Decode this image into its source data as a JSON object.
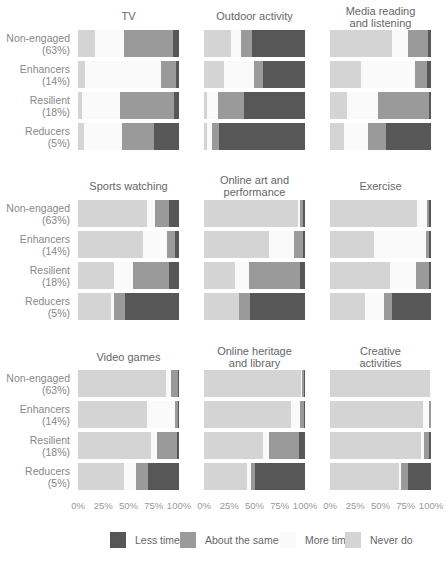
{
  "colors": {
    "less_time": "#575757",
    "about_same": "#9a9a9a",
    "more_time": "#fafafa",
    "never_do": "#d4d4d4"
  },
  "groups": [
    {
      "name": "Non-engaged",
      "share": "(63%)"
    },
    {
      "name": "Enhancers",
      "share": "(14%)"
    },
    {
      "name": "Resilient",
      "share": "(18%)"
    },
    {
      "name": "Reducers",
      "share": "(5%)"
    }
  ],
  "axis_ticks": [
    "0%",
    "25%",
    "50%",
    "75%",
    "100%"
  ],
  "legend": [
    {
      "label": "Less time",
      "key": "less_time"
    },
    {
      "label": "About the same",
      "key": "about_same"
    },
    {
      "label": "More time",
      "key": "more_time"
    },
    {
      "label": "Never do",
      "key": "never_do"
    }
  ],
  "chart_data": {
    "type": "bar",
    "orientation": "horizontal",
    "stacked": true,
    "normalized": true,
    "xlabel": "",
    "ylabel": "",
    "xlim": [
      0,
      100
    ],
    "grid": false,
    "legend_position": "bottom",
    "categories": [
      "Non-engaged (63%)",
      "Enhancers (14%)",
      "Resilient (18%)",
      "Reducers (5%)"
    ],
    "segment_order": [
      "Never do",
      "More time",
      "About the same",
      "Less time"
    ],
    "panels": [
      {
        "title": "TV",
        "series": [
          {
            "name": "Never do",
            "values": [
              17,
              7,
              4,
              6
            ]
          },
          {
            "name": "More time",
            "values": [
              29,
              75,
              38,
              38
            ]
          },
          {
            "name": "About the same",
            "values": [
              48,
              15,
              53,
              31
            ]
          },
          {
            "name": "Less time",
            "values": [
              6,
              3,
              5,
              25
            ]
          }
        ]
      },
      {
        "title": "Outdoor activity",
        "series": [
          {
            "name": "Never do",
            "values": [
              27,
              20,
              3,
              3
            ]
          },
          {
            "name": "More time",
            "values": [
              10,
              30,
              11,
              5
            ]
          },
          {
            "name": "About the same",
            "values": [
              11,
              8,
              26,
              7
            ]
          },
          {
            "name": "Less time",
            "values": [
              52,
              42,
              60,
              85
            ]
          }
        ]
      },
      {
        "title": "Media reading and listening",
        "series": [
          {
            "name": "Never do",
            "values": [
              61,
              31,
              17,
              14
            ]
          },
          {
            "name": "More time",
            "values": [
              16,
              53,
              31,
              24
            ]
          },
          {
            "name": "About the same",
            "values": [
              20,
              12,
              50,
              17
            ]
          },
          {
            "name": "Less time",
            "values": [
              3,
              4,
              2,
              45
            ]
          }
        ]
      },
      {
        "title": "Sports watching",
        "series": [
          {
            "name": "Never do",
            "values": [
              68,
              64,
              36,
              33
            ]
          },
          {
            "name": "More time",
            "values": [
              8,
              24,
              18,
              3
            ]
          },
          {
            "name": "About the same",
            "values": [
              14,
              8,
              36,
              11
            ]
          },
          {
            "name": "Less time",
            "values": [
              10,
              4,
              10,
              53
            ]
          }
        ]
      },
      {
        "title": "Online art and performance",
        "series": [
          {
            "name": "Never do",
            "values": [
              93,
              64,
              31,
              35
            ]
          },
          {
            "name": "More time",
            "values": [
              2,
              25,
              14,
              0
            ]
          },
          {
            "name": "About the same",
            "values": [
              3,
              9,
              50,
              11
            ]
          },
          {
            "name": "Less time",
            "values": [
              2,
              2,
              5,
              54
            ]
          }
        ]
      },
      {
        "title": "Exercise",
        "series": [
          {
            "name": "Never do",
            "values": [
              86,
              44,
              59,
              35
            ]
          },
          {
            "name": "More time",
            "values": [
              10,
              51,
              26,
              18
            ]
          },
          {
            "name": "About the same",
            "values": [
              2,
              3,
              13,
              8
            ]
          },
          {
            "name": "Less time",
            "values": [
              2,
              2,
              2,
              39
            ]
          }
        ]
      },
      {
        "title": "Video games",
        "series": [
          {
            "name": "Never do",
            "values": [
              87,
              68,
              72,
              46
            ]
          },
          {
            "name": "More time",
            "values": [
              5,
              28,
              6,
              11
            ]
          },
          {
            "name": "About the same",
            "values": [
              7,
              3,
              20,
              12
            ]
          },
          {
            "name": "Less time",
            "values": [
              1,
              1,
              2,
              31
            ]
          }
        ]
      },
      {
        "title": "Online heritage and library",
        "series": [
          {
            "name": "Never do",
            "values": [
              96,
              86,
              58,
              43
            ]
          },
          {
            "name": "More time",
            "values": [
              1,
              9,
              6,
              4
            ]
          },
          {
            "name": "About the same",
            "values": [
              2,
              4,
              30,
              4
            ]
          },
          {
            "name": "Less time",
            "values": [
              1,
              1,
              6,
              49
            ]
          }
        ]
      },
      {
        "title": "Creative activities",
        "series": [
          {
            "name": "Never do",
            "values": [
              99,
              92,
              90,
              68
            ]
          },
          {
            "name": "More time",
            "values": [
              1,
              6,
              3,
              2
            ]
          },
          {
            "name": "About the same",
            "values": [
              0,
              2,
              5,
              7
            ]
          },
          {
            "name": "Less time",
            "values": [
              0,
              0,
              2,
              23
            ]
          }
        ]
      }
    ]
  },
  "panel_titles": {
    "tv": "TV",
    "outdoor": "Outdoor activity",
    "media_1": "Media reading",
    "media_2": "and listening",
    "sports": "Sports watching",
    "art_1": "Online art and",
    "art_2": "performance",
    "exercise": "Exercise",
    "video": "Video games",
    "heritage_1": "Online heritage",
    "heritage_2": "and library",
    "creative_1": "Creative",
    "creative_2": "activities"
  }
}
